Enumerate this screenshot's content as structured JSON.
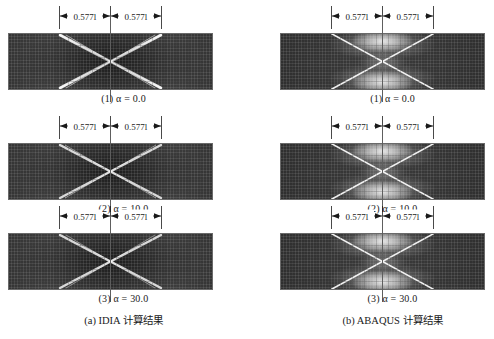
{
  "figure": {
    "background_color": "#ffffff",
    "specimen_fill_color": "#3b3b3b",
    "band_color": "#f2f2f2",
    "annotation_color": "#1a1a1a"
  },
  "dimension": {
    "label_left": "0.577l",
    "label_right": "0.577l",
    "value": "0.577",
    "symbol": "l"
  },
  "columns": [
    {
      "id": "a",
      "caption": "(a) IDIA 计算结果",
      "method": "IDIA",
      "subfigures": [
        {
          "index": "(1)",
          "param_label": "α",
          "equals": "=",
          "value": "0.0",
          "caption": "(1) α = 0.0"
        },
        {
          "index": "(2)",
          "param_label": "α",
          "equals": "=",
          "value": "10.0",
          "caption": "(2) α = 10.0"
        },
        {
          "index": "(3)",
          "param_label": "α",
          "equals": "=",
          "value": "30.0",
          "caption": "(3) α = 30.0"
        }
      ]
    },
    {
      "id": "b",
      "caption": "(b) ABAQUS 计算结果",
      "method": "ABAQUS",
      "subfigures": [
        {
          "index": "(1)",
          "param_label": "α",
          "equals": "=",
          "value": "0.0",
          "caption": "(1) α = 0.0"
        },
        {
          "index": "(2)",
          "param_label": "α",
          "equals": "=",
          "value": "10.0",
          "caption": "(2) α = 10.0"
        },
        {
          "index": "(3)",
          "param_label": "α",
          "equals": "=",
          "value": "30.0",
          "caption": "(3) α = 30.0"
        }
      ]
    }
  ]
}
